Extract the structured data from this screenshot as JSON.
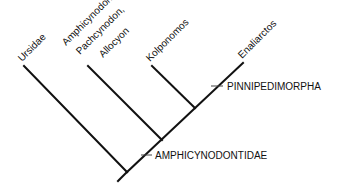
{
  "diagram": {
    "type": "cladogram",
    "taxa": [
      {
        "id": "ursidae",
        "lines": [
          "Ursidae"
        ]
      },
      {
        "id": "amphicynodon",
        "lines": [
          "Amphicynodon,",
          "Pachcynodon,",
          "Allocyon"
        ]
      },
      {
        "id": "kolponomos",
        "lines": [
          "Kolponomos"
        ]
      },
      {
        "id": "enaliarctos",
        "lines": [
          "Enaliarctos"
        ]
      }
    ],
    "clades": [
      {
        "id": "pinnipedimorpha",
        "label": "PINNIPEDIMORPHA"
      },
      {
        "id": "amphicynodontidae",
        "label": "AMPHICYNODONTIDAE"
      }
    ],
    "colors": {
      "line": "#111111",
      "text": "#111111",
      "background": "#ffffff"
    }
  }
}
